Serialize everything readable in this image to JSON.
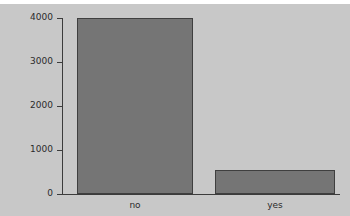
{
  "chart_data": {
    "type": "bar",
    "title": "",
    "subtitle": "",
    "xlabel": "",
    "ylabel": "",
    "categories": [
      "no",
      "yes"
    ],
    "values": [
      4000,
      550
    ],
    "series": [
      {
        "name": "count",
        "values": [
          4000,
          550
        ]
      }
    ],
    "ylim": [
      0,
      4000
    ],
    "ytick_labels": [
      "0",
      "1000",
      "2000",
      "3000",
      "4000"
    ],
    "ytick_values": [
      0,
      1000,
      2000,
      3000,
      4000
    ],
    "grid": false,
    "legend": "none",
    "colors": {
      "background": "#c8c8c8",
      "bar_fill": "#757575",
      "bar_border": "#3f3f3f",
      "axis": "#3c3c3c",
      "text": "#2b2b2b"
    }
  }
}
